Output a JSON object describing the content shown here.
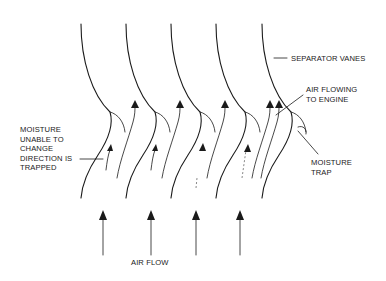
{
  "diagram": {
    "type": "inertial moisture separator schematic",
    "colors": {
      "ink": "#1a1a1a",
      "background": "#ffffff"
    },
    "labels": {
      "separator_vanes": "SEPARATOR VANES",
      "air_flowing_to_engine": "AIR FLOWING\nTO ENGINE",
      "moisture_trap": "MOISTURE\nTRAP",
      "moisture_trapped": "MOISTURE\nUNABLE TO\nCHANGE\nDIRECTION IS\nTRAPPED",
      "air_flow": "AIR FLOW"
    },
    "vanes": [
      {
        "id": 1,
        "x_offset": 0
      },
      {
        "id": 2,
        "x_offset": 45
      },
      {
        "id": 3,
        "x_offset": 90
      },
      {
        "id": 4,
        "x_offset": 135
      },
      {
        "id": 5,
        "x_offset": 181
      }
    ],
    "inlet_arrows_count": 4
  }
}
